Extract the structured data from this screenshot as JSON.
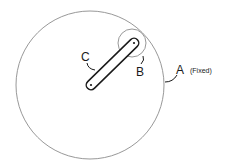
{
  "diagram": {
    "type": "planetary-gear-mechanism",
    "colors": {
      "outline": "#8c8c8c",
      "link": "#1a1a1a",
      "background": "#ffffff"
    },
    "components": {
      "gear_a": {
        "label": "A",
        "note": "(Fixed)",
        "shape": "large-circle",
        "center": [
          90,
          85
        ],
        "radius": 74
      },
      "gear_b": {
        "label": "B",
        "shape": "small-circle",
        "center": [
          132,
          43
        ],
        "radius": 14
      },
      "arm_c": {
        "label": "C",
        "shape": "rounded-link",
        "from": [
          91,
          85
        ],
        "to": [
          134,
          43
        ]
      }
    }
  }
}
